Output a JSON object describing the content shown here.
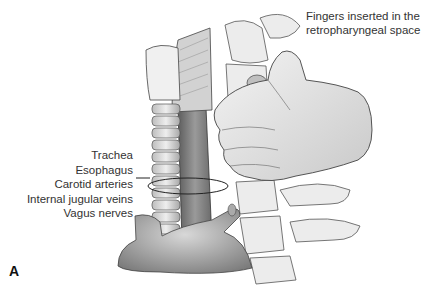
{
  "figure": {
    "panel_label": "A",
    "top_caption": {
      "line1": "Fingers inserted in the",
      "line2": "retropharyngeal space"
    },
    "structure_labels": [
      "Trachea",
      "Esophagus",
      "Carotid arteries",
      "Internal jugular veins",
      "Vagus nerves"
    ],
    "colors": {
      "background": "#ffffff",
      "line": "#222222",
      "tissue_light": "#e6e6e6",
      "tissue_mid": "#b5b5b5",
      "tissue_dark": "#6f6f6f"
    }
  }
}
